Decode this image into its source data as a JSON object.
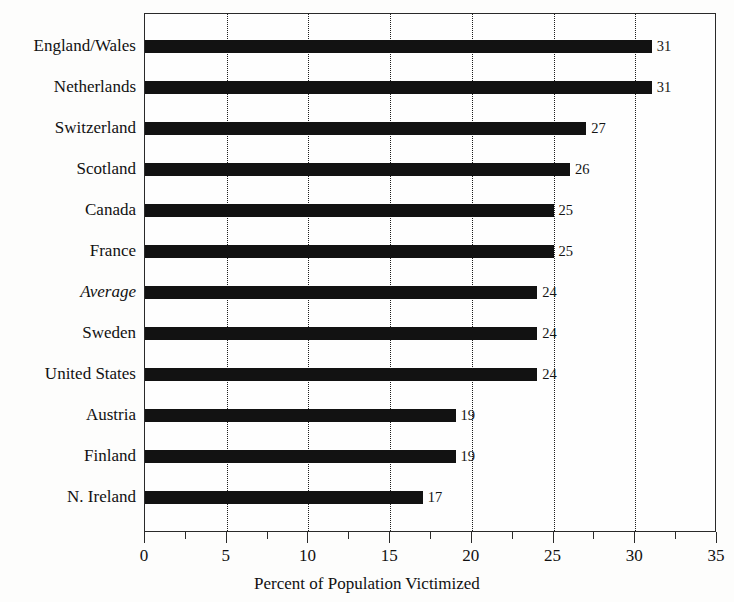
{
  "chart_data": {
    "type": "bar",
    "orientation": "horizontal",
    "title": "",
    "xlabel": "Percent of Population Victimized",
    "ylabel": "",
    "xlim": [
      0,
      35
    ],
    "xticks": [
      0,
      5,
      10,
      15,
      20,
      25,
      30,
      35
    ],
    "xtick_labels": [
      "0",
      "5",
      "10",
      "15",
      "20",
      "25",
      "30",
      "35"
    ],
    "minor_xticks": [
      2.5,
      7.5,
      12.5,
      17.5,
      22.5,
      27.5,
      32.5
    ],
    "grid": "vertical-dotted",
    "legend": "none",
    "bar_color": "#121212",
    "categories": [
      "England/Wales",
      "Netherlands",
      "Switzerland",
      "Scotland",
      "Canada",
      "France",
      "Average",
      "Sweden",
      "United States",
      "Austria",
      "Finland",
      "N. Ireland"
    ],
    "values": [
      31,
      31,
      27,
      26,
      25,
      25,
      24,
      24,
      24,
      19,
      19,
      17
    ],
    "value_labels": [
      "31",
      "31",
      "27",
      "26",
      "25",
      "25",
      "24",
      "24",
      "24",
      "19",
      "19",
      "17"
    ],
    "emphasis": {
      "italic_categories": [
        "Average"
      ]
    }
  }
}
